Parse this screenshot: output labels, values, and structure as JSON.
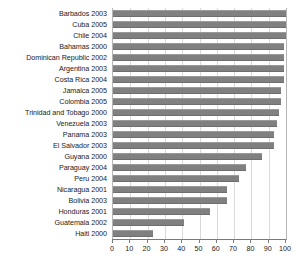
{
  "chart_data": {
    "type": "bar",
    "orientation": "horizontal",
    "title": "",
    "subtitle": "",
    "xlabel": "",
    "ylabel": "",
    "xlim": [
      0,
      100
    ],
    "xticks": [
      0,
      10,
      20,
      30,
      40,
      50,
      60,
      70,
      80,
      90,
      100
    ],
    "grid": true,
    "legend": false,
    "bar_color": "#808080",
    "categories": [
      "Barbados 2003",
      "Cuba 2005",
      "Chile 2004",
      "Bahamas 2000",
      "Dominican Republic 2002",
      "Argentina 2003",
      "Costa Rica 2004",
      "Jamaica 2005",
      "Colombia 2005",
      "Trinidad and Tobago 2000",
      "Venezuela 2003",
      "Panama 2003",
      "El Salvador 2003",
      "Guyana 2000",
      "Paraguay 2004",
      "Peru 2004",
      "Nicaragua 2001",
      "Bolivia 2003",
      "Honduras 2001",
      "Guatemala 2002",
      "Haiti 2000"
    ],
    "values": [
      100,
      100,
      100,
      99,
      99,
      99,
      99,
      97,
      97,
      96,
      95,
      93,
      93,
      86,
      77,
      73,
      66,
      66,
      56,
      41,
      23
    ]
  }
}
